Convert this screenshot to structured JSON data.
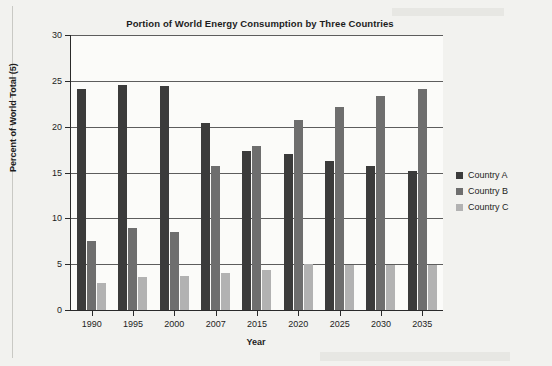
{
  "chart_data": {
    "type": "bar",
    "title": "Portion of World Energy Consumption by Three Countries",
    "xlabel": "Year",
    "ylabel": "Percent of World Total (5)",
    "categories": [
      "1990",
      "1995",
      "2000",
      "2007",
      "2015",
      "2020",
      "2025",
      "2030",
      "2035"
    ],
    "series": [
      {
        "name": "Country A",
        "color": "#3b3b3b",
        "values": [
          24.1,
          24.5,
          24.4,
          20.4,
          17.3,
          17.0,
          16.3,
          15.7,
          15.2
        ]
      },
      {
        "name": "Country B",
        "color": "#6e6e6e",
        "values": [
          7.5,
          9.0,
          8.5,
          15.7,
          17.9,
          20.7,
          22.2,
          23.3,
          24.1
        ]
      },
      {
        "name": "Country C",
        "color": "#b2b2b2",
        "values": [
          2.9,
          3.6,
          3.7,
          4.0,
          4.4,
          5.0,
          4.95,
          4.95,
          4.95
        ]
      }
    ],
    "ylim": [
      0,
      30
    ],
    "yticks": [
      0,
      5,
      10,
      15,
      20,
      25,
      30
    ],
    "ytick_labels": [
      "0",
      "5",
      "10",
      "15",
      "20",
      "25",
      "30"
    ],
    "grid": true,
    "legend_position": "right"
  }
}
